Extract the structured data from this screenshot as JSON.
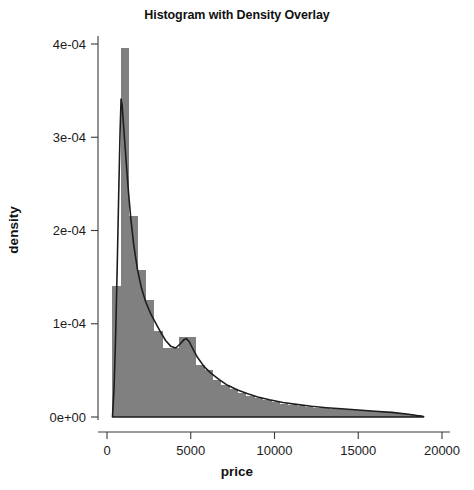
{
  "chart_data": {
    "type": "bar",
    "title": "Histogram with Density Overlay",
    "xlabel": "price",
    "ylabel": "density",
    "xlim": [
      0,
      20000
    ],
    "ylim": [
      0,
      0.00043
    ],
    "grid": false,
    "legend": null,
    "x_ticks": [
      0,
      5000,
      10000,
      15000,
      20000
    ],
    "x_tick_labels": [
      "0",
      "5000",
      "10000",
      "15000",
      "20000"
    ],
    "y_ticks": [
      0,
      0.0001,
      0.0002,
      0.0003,
      0.0004
    ],
    "y_tick_labels": [
      "0e+00",
      "1e-04",
      "2e-04",
      "3e-04",
      "4e-04"
    ],
    "bar_color": "#808080",
    "line_color": "#1d1d1d",
    "bin_width": 500,
    "bin_edges": [
      326,
      826,
      1326,
      1826,
      2326,
      2826,
      3326,
      3826,
      4326,
      4826,
      5326,
      5826,
      6326,
      6826,
      7326,
      7826,
      8326,
      8826,
      9326,
      9826,
      10326,
      10826,
      11326,
      11826,
      12326,
      12826,
      13326,
      13826,
      14326,
      14826,
      15326,
      15826,
      16326,
      16826,
      17326,
      17826,
      18326,
      18826
    ],
    "categories": [
      "326-826",
      "826-1326",
      "1326-1826",
      "1826-2326",
      "2326-2826",
      "2826-3326",
      "3326-3826",
      "3826-4326",
      "4326-4826",
      "4826-5326",
      "5326-5826",
      "5826-6326",
      "6326-6826",
      "6826-7326",
      "7326-7826",
      "7826-8326",
      "8326-8826",
      "8826-9326",
      "9326-9826",
      "9826-10326",
      "10326-10826",
      "10826-11326",
      "11326-11826",
      "11826-12326",
      "12326-12826",
      "12826-13326",
      "13326-13826",
      "13826-14326",
      "14326-14826",
      "14826-15326",
      "15326-15826",
      "15826-16326",
      "16326-16826",
      "16826-17326",
      "17326-17826",
      "17826-18326",
      "18326-18826"
    ],
    "values": [
      0.00014,
      0.000396,
      0.000216,
      0.000158,
      0.000126,
      9.2e-05,
      7.4e-05,
      7.4e-05,
      8.6e-05,
      8.6e-05,
      5.6e-05,
      5e-05,
      4e-05,
      3.4e-05,
      3e-05,
      2.6e-05,
      2.2e-05,
      2e-05,
      1.8e-05,
      1.6e-05,
      1.4e-05,
      1.3e-05,
      1.2e-05,
      1.1e-05,
      1e-05,
      9.5e-06,
      9e-06,
      8.5e-06,
      8e-06,
      7.2e-06,
      6.5e-06,
      6e-06,
      5.5e-06,
      5e-06,
      4.2e-06,
      3.2e-06,
      1.8e-06
    ],
    "series": [
      {
        "name": "density",
        "type": "line",
        "x": [
          326,
          420,
          520,
          620,
          700,
          780,
          840,
          900,
          980,
          1060,
          1160,
          1280,
          1420,
          1600,
          1820,
          2060,
          2320,
          2600,
          2900,
          3200,
          3500,
          3800,
          4100,
          4350,
          4600,
          4750,
          4900,
          5100,
          5400,
          5800,
          6200,
          6700,
          7200,
          7800,
          8400,
          9000,
          9700,
          10500,
          11300,
          12200,
          13100,
          14000,
          15000,
          16000,
          17000,
          18000,
          18900
        ],
        "y": [
          0.0,
          3e-05,
          9e-05,
          0.00017,
          0.00024,
          0.000305,
          0.000341,
          0.000335,
          0.000315,
          0.000295,
          0.00027,
          0.000242,
          0.000213,
          0.000184,
          0.000158,
          0.000138,
          0.000123,
          0.000111,
          0.000101,
          9.1e-05,
          8.2e-05,
          7.6e-05,
          7.4e-05,
          7.8e-05,
          8.3e-05,
          8.4e-05,
          8.1e-05,
          7.4e-05,
          6.4e-05,
          5.4e-05,
          4.7e-05,
          4e-05,
          3.4e-05,
          2.9e-05,
          2.5e-05,
          2.15e-05,
          1.85e-05,
          1.55e-05,
          1.35e-05,
          1.15e-05,
          1e-05,
          8.8e-06,
          7.5e-06,
          6.2e-06,
          5e-06,
          3e-06,
          5e-07
        ]
      }
    ]
  },
  "figure": {
    "background_color": "#ffffff"
  }
}
